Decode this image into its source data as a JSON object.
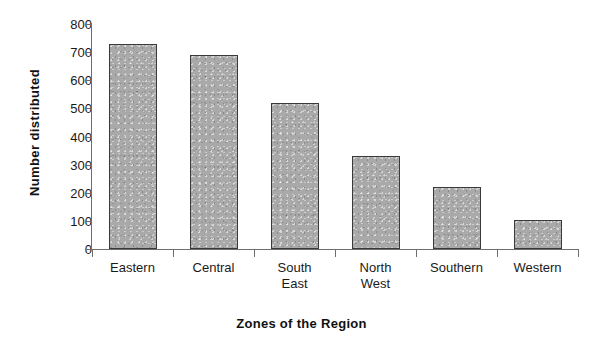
{
  "chart_data": {
    "type": "bar",
    "title": "",
    "xlabel": "Zones of the Region",
    "ylabel": "Number distributed",
    "categories": [
      "Eastern",
      "Central",
      "South East",
      "North West",
      "Southern",
      "Western"
    ],
    "category_lines": [
      [
        "Eastern"
      ],
      [
        "Central"
      ],
      [
        "South",
        "East"
      ],
      [
        "North",
        "West"
      ],
      [
        "Southern"
      ],
      [
        "Western"
      ]
    ],
    "values": [
      730,
      690,
      520,
      330,
      220,
      103
    ],
    "ylim": [
      0,
      800
    ],
    "ytick_values": [
      0,
      100,
      200,
      300,
      400,
      500,
      600,
      700,
      800
    ],
    "ytick_labels": [
      "0",
      "100",
      "200",
      "300",
      "400",
      "500",
      "600",
      "700",
      "800"
    ],
    "grid": false,
    "legend": false,
    "legend_position": "none",
    "bar_fill_color": "#a9a9a9",
    "bar_border_color": "#3a3a3a",
    "axis_color": "#6e6e6e",
    "background_color": "#ffffff"
  }
}
